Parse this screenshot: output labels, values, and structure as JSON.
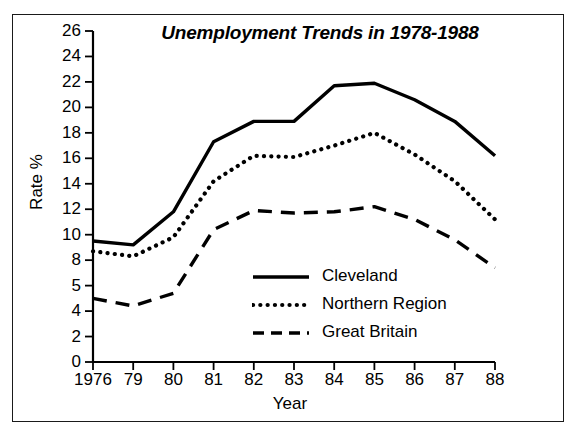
{
  "figure": {
    "title": "Unemployment Trends in 1978-1988",
    "border_color": "#1a1a1a",
    "background": "#ffffff",
    "line_color": "#000000"
  },
  "axes": {
    "ylabel": "Rate %",
    "xlabel": "Year",
    "yticks": [
      "26",
      "24",
      "22",
      "20",
      "18",
      "16",
      "14",
      "12",
      "10",
      "8",
      "5",
      "4",
      "2",
      "0"
    ],
    "xticks": [
      "1976",
      "79",
      "80",
      "81",
      "82",
      "83",
      "84",
      "85",
      "86",
      "87",
      "88"
    ]
  },
  "legend": {
    "items": [
      {
        "label": "Cleveland",
        "style": "solid"
      },
      {
        "label": "Northern Region",
        "style": "dotted"
      },
      {
        "label": "Great Britain",
        "style": "dashed"
      }
    ]
  },
  "chart_data": {
    "type": "line",
    "title": "Unemployment Trends in 1978-1988",
    "xlabel": "Year",
    "ylabel": "Rate %",
    "categories": [
      "1976",
      "79",
      "80",
      "81",
      "82",
      "83",
      "84",
      "85",
      "86",
      "87",
      "88"
    ],
    "ylim": [
      0,
      26
    ],
    "ytick_values": [
      26,
      24,
      22,
      20,
      18,
      16,
      14,
      12,
      10,
      8,
      5,
      4,
      2,
      0
    ],
    "grid": false,
    "legend_position": "center-right-inside",
    "series": [
      {
        "name": "Cleveland",
        "style": "solid",
        "color": "#000000",
        "values": [
          9.5,
          9.2,
          11.8,
          17.3,
          18.9,
          18.9,
          21.7,
          21.9,
          20.6,
          18.9,
          16.2
        ]
      },
      {
        "name": "Northern Region",
        "style": "dotted",
        "color": "#000000",
        "values": [
          8.7,
          8.3,
          9.8,
          14.2,
          16.2,
          16.1,
          17.0,
          18.0,
          16.3,
          14.2,
          11.2
        ]
      },
      {
        "name": "Great Britain",
        "style": "dashed",
        "color": "#000000",
        "values": [
          5.0,
          4.4,
          5.4,
          10.4,
          11.9,
          11.7,
          11.8,
          12.2,
          11.2,
          9.6,
          7.4
        ]
      }
    ]
  }
}
